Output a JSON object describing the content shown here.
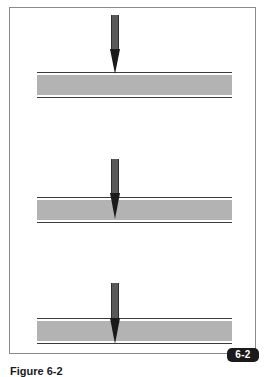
{
  "figure": {
    "badge_label": "6-2",
    "caption": "Figure 6-2",
    "panels": [
      {
        "id": "panel-1",
        "depiction": "probe-above-material",
        "penetration": 0.0
      },
      {
        "id": "panel-2",
        "depiction": "probe-partially-penetrating",
        "penetration": 0.85
      },
      {
        "id": "panel-3",
        "depiction": "probe-fully-penetrating",
        "penetration": 1.0
      }
    ],
    "colors": {
      "frame": "#8a8a8a",
      "band_fill": "#b3b3b3",
      "band_edge": "#3a3a3a",
      "probe_shaft": "#5a5a5a",
      "probe_tip": "#1a1a1a",
      "badge_bg": "#1a1a1a",
      "badge_text": "#ffffff"
    }
  }
}
